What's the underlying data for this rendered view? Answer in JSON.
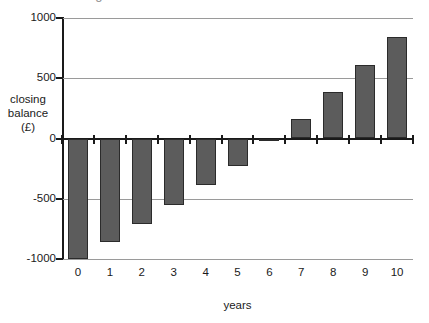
{
  "chart_data": {
    "type": "bar",
    "title": "",
    "xlabel": "years",
    "ylabel": "closing balance (£)",
    "ylabel_lines": [
      "closing",
      "balance",
      "(£)"
    ],
    "categories": [
      "0",
      "1",
      "2",
      "3",
      "4",
      "5",
      "6",
      "7",
      "8",
      "9",
      "10"
    ],
    "values": [
      -1000,
      -860,
      -710,
      -555,
      -390,
      -225,
      -20,
      160,
      385,
      610,
      845
    ],
    "ylim": [
      -1000,
      1000
    ],
    "ytick_labels": [
      "1000",
      "500",
      "0",
      "-500",
      "-1000"
    ],
    "ytick_values": [
      1000,
      500,
      0,
      -500,
      -1000
    ],
    "grid": true,
    "legend": false,
    "bar_color": "#5c5c5c",
    "bar_border_color": "#2b2b2b",
    "gridline_color": "#9a9a9a",
    "axis_color": "#1a1a1a"
  },
  "cropped_title": "closing balance"
}
